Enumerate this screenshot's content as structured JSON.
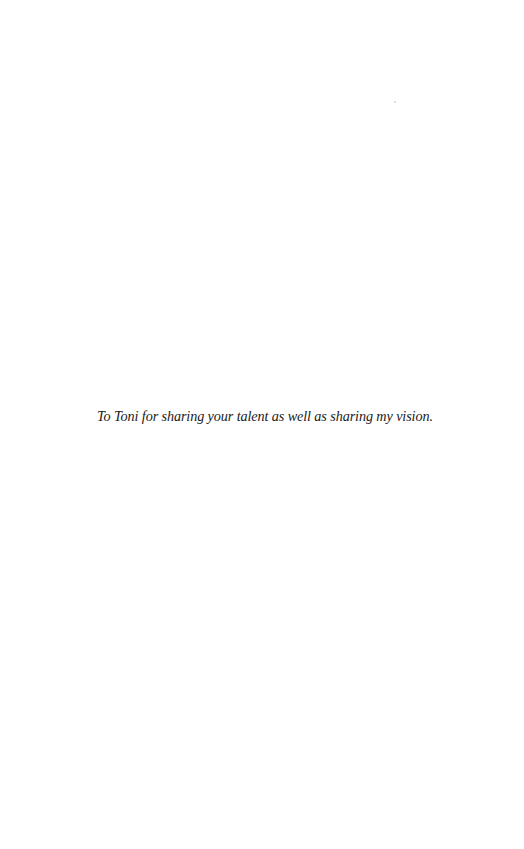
{
  "page": {
    "background": "#ffffff",
    "text_color": "#1a1a1a"
  },
  "dedication": {
    "text": "To Toni for sharing your talent as well as sharing my vision."
  }
}
